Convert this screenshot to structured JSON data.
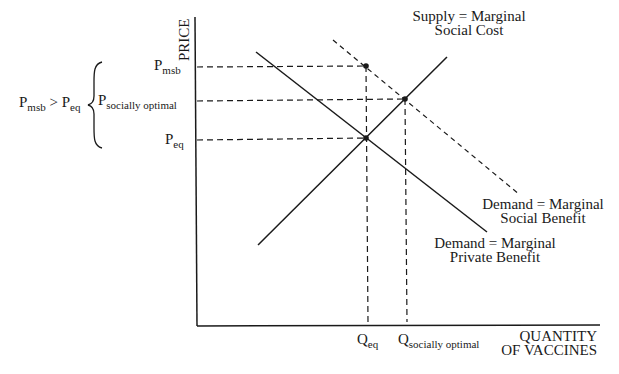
{
  "axes": {
    "y_label": "PRICE",
    "x_label_line1": "QUANTITY",
    "x_label_line2": "OF VACCINES"
  },
  "price_labels": {
    "p_msb": {
      "main": "P",
      "sub": "msb"
    },
    "p_socially_optimal": {
      "main": "P",
      "sub": "socially optimal"
    },
    "p_eq": {
      "main": "P",
      "sub": "eq"
    }
  },
  "quantity_labels": {
    "q_eq": {
      "main": "Q",
      "sub": "eq"
    },
    "q_socially_optimal": {
      "main": "Q",
      "sub": "socially optimal"
    }
  },
  "comparison": {
    "left_main": "P",
    "left_sub": "msb",
    "operator": ">",
    "right_main": "P",
    "right_sub": "eq"
  },
  "curves": {
    "supply_line1": "Supply = Marginal",
    "supply_line2": "Social Cost",
    "msb_line1": "Demand = Marginal",
    "msb_line2": "Social Benefit",
    "mpb_line1": "Demand = Marginal",
    "mpb_line2": "Private Benefit"
  },
  "colors": {
    "ink": "#1a1a1a",
    "background": "#ffffff"
  }
}
